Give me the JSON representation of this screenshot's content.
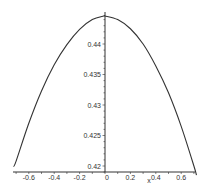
{
  "chart_data": {
    "type": "line",
    "title": "",
    "xlabel": "x",
    "ylabel": "",
    "xlim": [
      -0.72,
      0.72
    ],
    "ylim": [
      0.419,
      0.4452
    ],
    "grid": false,
    "legend": null,
    "x_ticks": [
      -0.6,
      -0.4,
      -0.2,
      0,
      0.2,
      0.4,
      0.6
    ],
    "x_tick_labels": [
      "-0.6",
      "-0.4",
      "-0.2",
      "0",
      "0.2",
      "0.4",
      "0.6"
    ],
    "y_ticks": [
      0.42,
      0.425,
      0.43,
      0.435,
      0.44
    ],
    "y_tick_labels": [
      "0.42",
      "0.425",
      "0.43",
      "0.435",
      "0.44"
    ],
    "series": [
      {
        "name": "curve",
        "color": "#333333",
        "x": [
          -0.72,
          -0.7,
          -0.6,
          -0.5,
          -0.4,
          -0.3,
          -0.2,
          -0.1,
          -0.01,
          0.0,
          0.1,
          0.2,
          0.3,
          0.4,
          0.5,
          0.6,
          0.7,
          0.72
        ],
        "y": [
          0.4199,
          0.4208,
          0.427,
          0.4323,
          0.4366,
          0.4399,
          0.4424,
          0.444,
          0.4446,
          0.4446,
          0.444,
          0.4425,
          0.44,
          0.4364,
          0.432,
          0.4265,
          0.42,
          0.4185
        ]
      }
    ]
  },
  "axes": {
    "x_label": "x",
    "axis_color": "#333333"
  }
}
